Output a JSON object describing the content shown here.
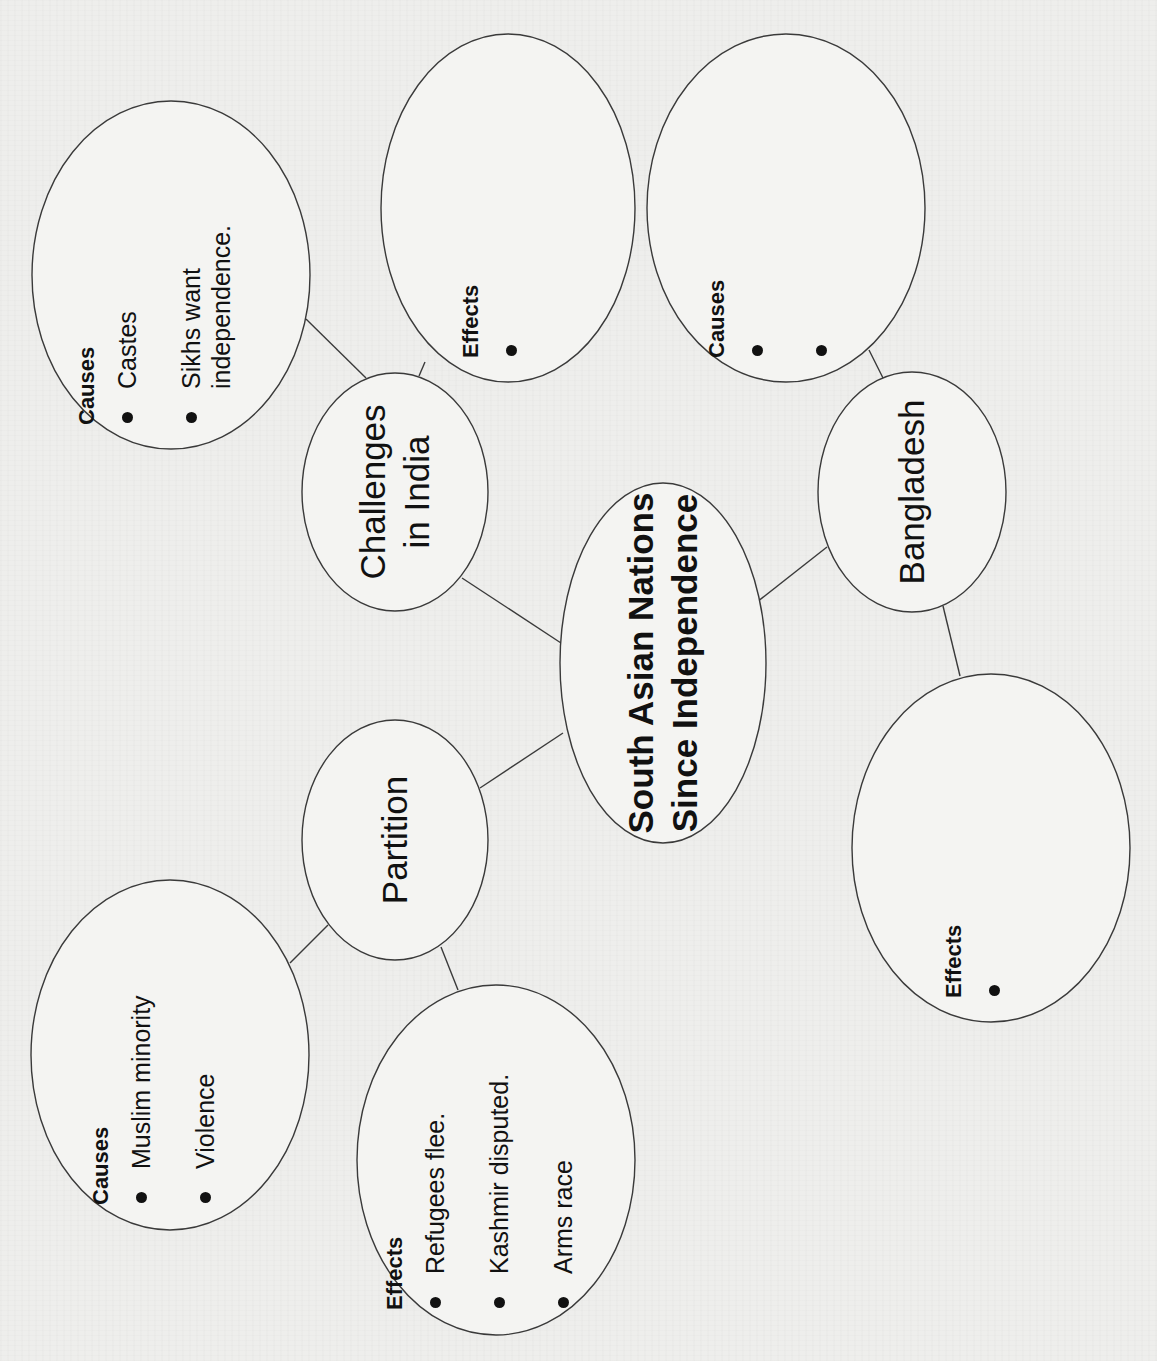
{
  "diagram": {
    "type": "concept-web",
    "orientation": "rotated-90-ccw",
    "center": {
      "id": "center",
      "title_lines": [
        "South Asian Nations",
        "Since Independence"
      ],
      "cx": 663,
      "cy": 663,
      "rx": 103,
      "ry": 180
    },
    "topics": [
      {
        "id": "challenges-india",
        "label_lines": [
          "Challenges",
          "in India"
        ],
        "cx": 395,
        "cy": 492,
        "rx": 93,
        "ry": 119
      },
      {
        "id": "bangladesh",
        "label_lines": [
          "Bangladesh"
        ],
        "cx": 912,
        "cy": 492,
        "rx": 94,
        "ry": 120
      },
      {
        "id": "partition",
        "label_lines": [
          "Partition"
        ],
        "cx": 395,
        "cy": 840,
        "rx": 93,
        "ry": 120
      }
    ],
    "details": [
      {
        "id": "india-causes",
        "parent": "challenges-india",
        "heading": "Causes",
        "bullets": [
          "Castes",
          "Sikhs want\nindependence."
        ],
        "cx": 171,
        "cy": 275,
        "rx": 139,
        "ry": 174
      },
      {
        "id": "india-effects",
        "parent": "challenges-india",
        "heading": "Effects",
        "bullets": [
          ""
        ],
        "cx": 508,
        "cy": 208,
        "rx": 127,
        "ry": 174
      },
      {
        "id": "bangladesh-causes",
        "parent": "bangladesh",
        "heading": "Causes",
        "bullets": [
          "",
          ""
        ],
        "cx": 786,
        "cy": 208,
        "rx": 139,
        "ry": 174
      },
      {
        "id": "bangladesh-effects",
        "parent": "bangladesh",
        "heading": "Effects",
        "bullets": [
          ""
        ],
        "cx": 991,
        "cy": 848,
        "rx": 139,
        "ry": 174
      },
      {
        "id": "partition-causes",
        "parent": "partition",
        "heading": "Causes",
        "bullets": [
          "Muslim minority",
          "Violence"
        ],
        "cx": 170,
        "cy": 1055,
        "rx": 139,
        "ry": 175
      },
      {
        "id": "partition-effects",
        "parent": "partition",
        "heading": "Effects",
        "bullets": [
          "Refugees flee.",
          "Kashmir disputed.",
          "Arms race"
        ],
        "cx": 496,
        "cy": 1160,
        "rx": 139,
        "ry": 175
      }
    ],
    "connectors": [
      {
        "from": "center",
        "to": "challenges-india",
        "x1": 561,
        "y1": 643,
        "x2": 462,
        "y2": 578
      },
      {
        "from": "center",
        "to": "bangladesh",
        "x1": 757,
        "y1": 602,
        "x2": 827,
        "y2": 547
      },
      {
        "from": "center",
        "to": "partition",
        "x1": 563,
        "y1": 733,
        "x2": 480,
        "y2": 788
      },
      {
        "from": "challenges-india",
        "to": "india-causes",
        "x1": 306,
        "y1": 319,
        "x2": 366,
        "y2": 378
      },
      {
        "from": "challenges-india",
        "to": "india-effects",
        "x1": 425,
        "y1": 362,
        "x2": 419,
        "y2": 376
      },
      {
        "from": "bangladesh",
        "to": "bangladesh-causes",
        "x1": 869,
        "y1": 350,
        "x2": 883,
        "y2": 378
      },
      {
        "from": "bangladesh",
        "to": "bangladesh-effects",
        "x1": 943,
        "y1": 606,
        "x2": 960,
        "y2": 676
      },
      {
        "from": "partition",
        "to": "partition-causes",
        "x1": 290,
        "y1": 963,
        "x2": 328,
        "y2": 925
      },
      {
        "from": "partition",
        "to": "partition-effects",
        "x1": 441,
        "y1": 947,
        "x2": 458,
        "y2": 990
      }
    ],
    "colors": {
      "background": "#eeeeec",
      "ellipse_fill": "#f4f4f2",
      "stroke": "#3a3a3a",
      "text": "#111111"
    }
  }
}
